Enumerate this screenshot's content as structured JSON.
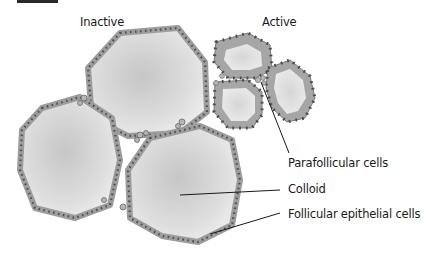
{
  "figure": {
    "type": "thyroid-follicle-illustration",
    "colors": {
      "background": "#ffffff",
      "colloid_center": "#c9c9c9",
      "colloid_edge": "#ededed",
      "epithelium": "#a9a9a9",
      "nucleus": "#5a5a5a",
      "leader_line": "#1a1a1a",
      "text": "#1a1a1a"
    },
    "group_labels": {
      "inactive": "Inactive",
      "active": "Active"
    },
    "callouts": [
      {
        "id": "parafollicular",
        "text": "Parafollicular cells"
      },
      {
        "id": "colloid",
        "text": "Colloid"
      },
      {
        "id": "follicular",
        "text": "Follicular epithelial cells"
      }
    ]
  }
}
